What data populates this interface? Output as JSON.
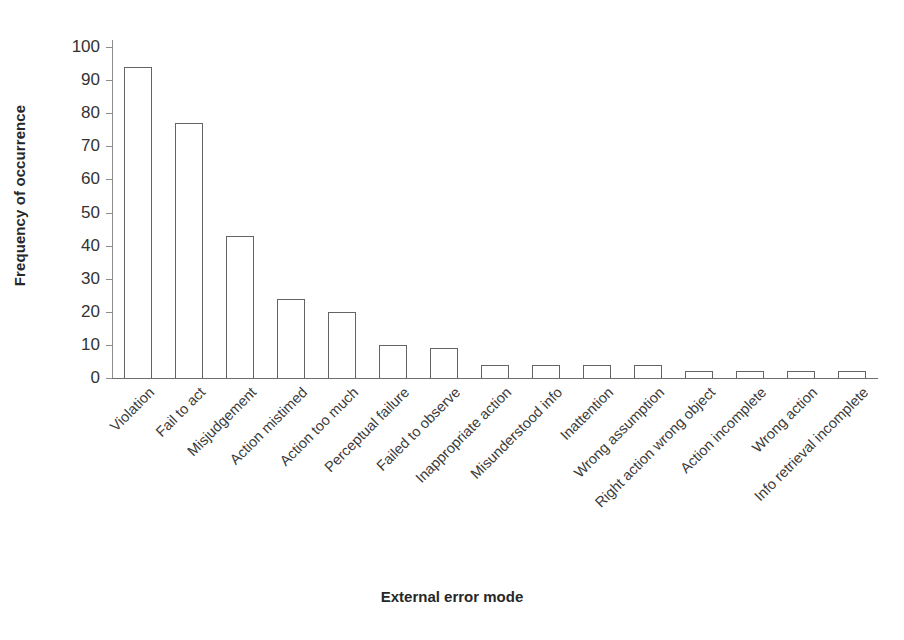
{
  "chart_data": {
    "type": "bar",
    "title": "",
    "xlabel": "External error mode",
    "ylabel": "Frequency of occurrence",
    "ylim": [
      0,
      100
    ],
    "yticks": [
      0,
      10,
      20,
      30,
      40,
      50,
      60,
      70,
      80,
      90,
      100
    ],
    "grid": false,
    "legend": null,
    "bar_style": {
      "fill": "#ffffff",
      "edge": "#646464"
    },
    "categories": [
      "Violation",
      "Fail to act",
      "Misjudgement",
      "Action mistimed",
      "Action too much",
      "Perceptual failure",
      "Failed to observe",
      "Inappropriate action",
      "Misunderstood info",
      "Inattention",
      "Wrong assumption",
      "Right action wrong object",
      "Action incomplete",
      "Wrong action",
      "Info retrieval incomplete"
    ],
    "values": [
      94,
      77,
      43,
      24,
      20,
      10,
      9,
      4,
      4,
      4,
      4,
      2,
      2,
      2,
      2
    ]
  }
}
